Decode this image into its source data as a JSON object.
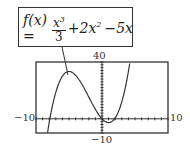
{
  "formula": {
    "lhs": "f(x) =",
    "frac_num": "x",
    "frac_num_exp": "3",
    "frac_den": "3",
    "term2": "+2x",
    "term2_exp": "2",
    "term3": "−5x"
  },
  "graph": {
    "y_max_label": "40",
    "y_min_label": "−10",
    "x_min_label": "−10",
    "x_max_label": "10"
  },
  "chart_data": {
    "type": "line",
    "series": [
      {
        "name": "f(x)",
        "expression": "x^3/3 + 2x^2 - 5x"
      }
    ],
    "xlim": [
      -10,
      10
    ],
    "ylim": [
      -10,
      40
    ],
    "tick_labels": {
      "x": [
        "-10",
        "10"
      ],
      "y": [
        "-10",
        "40"
      ]
    },
    "grid": false
  }
}
